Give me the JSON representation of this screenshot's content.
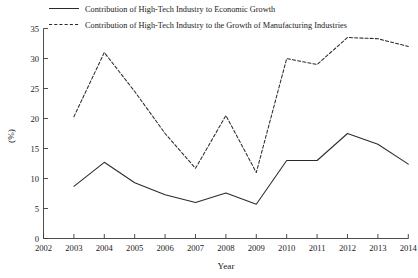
{
  "chart_data": {
    "type": "line",
    "title": "",
    "xlabel": "Year",
    "ylabel": "(%)",
    "x": [
      2003,
      2004,
      2005,
      2006,
      2007,
      2008,
      2009,
      2010,
      2011,
      2012,
      2013,
      2014
    ],
    "xticks": [
      "2002",
      "2003",
      "2004",
      "2005",
      "2006",
      "2007",
      "2008",
      "2009",
      "2010",
      "2011",
      "2012",
      "2013",
      "2014"
    ],
    "yticks": [
      "0",
      "5",
      "10",
      "15",
      "20",
      "25",
      "30",
      "35"
    ],
    "xlim": [
      2002,
      2014
    ],
    "ylim": [
      0,
      35
    ],
    "grid": false,
    "legend_position": "top",
    "series": [
      {
        "name": "Contribution of High-Tech Industry to Economic Growth",
        "style": "solid",
        "color": "#2b2b2b",
        "values": [
          8.7,
          12.7,
          9.3,
          7.3,
          6.0,
          7.6,
          5.7,
          13.0,
          13.0,
          17.5,
          15.7,
          12.4
        ]
      },
      {
        "name": "Contribution of High-Tech Industry to the Growth of Manufacturing Industries",
        "style": "dashed",
        "color": "#2b2b2b",
        "values": [
          20.3,
          31.0,
          24.5,
          17.5,
          11.7,
          20.5,
          11.0,
          30.0,
          29.0,
          33.5,
          33.3,
          32.0
        ]
      }
    ]
  },
  "legend": {
    "entries": [
      {
        "label": "Contribution of High-Tech Industry to Economic Growth",
        "style": "solid"
      },
      {
        "label": "Contribution of High-Tech Industry to the Growth of Manufacturing Industries",
        "style": "dashed"
      }
    ]
  },
  "axes": {
    "x_title": "Year",
    "y_title": "(%)"
  }
}
